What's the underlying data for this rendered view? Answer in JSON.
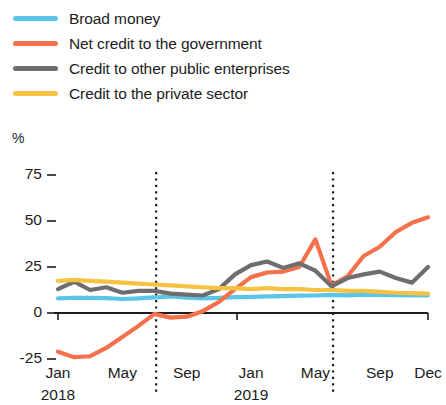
{
  "chart_data": {
    "type": "line",
    "title": "",
    "subtitle": "",
    "xlabel": "",
    "ylabel": "%",
    "ylim": [
      -32,
      80
    ],
    "yticks": [
      -25,
      0,
      25,
      50,
      75
    ],
    "ytick_labels": [
      "-25",
      "0",
      "25",
      "50",
      "75"
    ],
    "grid": false,
    "legend_position": "top-left",
    "x": [
      "2018-01",
      "2018-02",
      "2018-03",
      "2018-04",
      "2018-05",
      "2018-06",
      "2018-07",
      "2018-08",
      "2018-09",
      "2018-10",
      "2018-11",
      "2018-12",
      "2019-01",
      "2019-02",
      "2019-03",
      "2019-04",
      "2019-05",
      "2019-06",
      "2019-07",
      "2019-08",
      "2019-09",
      "2019-10",
      "2019-11",
      "2019-12"
    ],
    "xticks": [
      {
        "label": "Jan",
        "year": "2018",
        "index": 0
      },
      {
        "label": "May",
        "year": "",
        "index": 4
      },
      {
        "label": "Sep",
        "year": "",
        "index": 8
      },
      {
        "label": "Jan",
        "year": "2019",
        "index": 12
      },
      {
        "label": "May",
        "year": "",
        "index": 16
      },
      {
        "label": "Sep",
        "year": "",
        "index": 20
      },
      {
        "label": "Dec",
        "year": "",
        "index": 23
      }
    ],
    "vertical_markers": [
      {
        "index": 6.1,
        "style": "dotted"
      },
      {
        "index": 17.1,
        "style": "dotted"
      }
    ],
    "zero_line": 0,
    "series": [
      {
        "name": "Broad money",
        "color": "#5BC5E8",
        "values": [
          8.0,
          8.3,
          8.2,
          8.1,
          7.6,
          8.0,
          8.5,
          9.0,
          8.4,
          8.0,
          8.2,
          8.6,
          8.8,
          9.0,
          9.2,
          9.4,
          9.5,
          9.8,
          9.6,
          10.0,
          9.8,
          9.7,
          9.6,
          9.6
        ]
      },
      {
        "name": "Net credit to the government",
        "color": "#F4714C",
        "values": [
          -21.0,
          -24.0,
          -23.5,
          -19.0,
          -13.0,
          -7.0,
          -0.5,
          -2.5,
          -2.0,
          1.0,
          6.0,
          13.0,
          19.5,
          22.0,
          22.5,
          25.0,
          40.0,
          15.0,
          20.0,
          31.0,
          36.0,
          44.0,
          49.0,
          52.0
        ]
      },
      {
        "name": "Credit to other public enterprises",
        "color": "#6E6E6E",
        "values": [
          13.0,
          17.0,
          12.5,
          14.0,
          11.0,
          12.0,
          12.0,
          10.5,
          10.0,
          9.5,
          13.0,
          21.0,
          26.0,
          28.0,
          24.5,
          27.0,
          23.0,
          14.5,
          19.0,
          21.0,
          22.5,
          19.0,
          16.5,
          25.0
        ]
      },
      {
        "name": "Credit to the private sector",
        "color": "#F5C242",
        "values": [
          17.5,
          18.0,
          17.5,
          17.0,
          16.5,
          16.0,
          15.5,
          15.0,
          14.5,
          14.0,
          13.5,
          13.5,
          13.0,
          13.5,
          13.0,
          13.0,
          12.5,
          12.5,
          12.0,
          12.0,
          11.5,
          11.0,
          10.8,
          10.5
        ]
      }
    ]
  },
  "legend": {
    "items": [
      {
        "label": "Broad money",
        "color": "#5BC5E8"
      },
      {
        "label": "Net credit to the government",
        "color": "#F4714C"
      },
      {
        "label": "Credit to other public enterprises",
        "color": "#6E6E6E"
      },
      {
        "label": "Credit to the private sector",
        "color": "#F5C242"
      }
    ]
  },
  "axes": {
    "unit_label": "%"
  }
}
